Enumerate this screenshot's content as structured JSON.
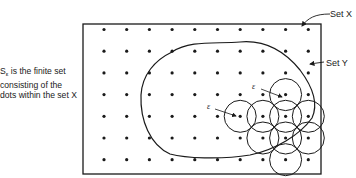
{
  "caption": {
    "symbol": "S",
    "subscript": "ε",
    "text": " is the finite set consisting of the dots within the set X"
  },
  "labels": {
    "set_x": "Set X",
    "set_y": "Set Y",
    "epsilon": "ε"
  },
  "grid": {
    "columns": 10,
    "rows": 7
  },
  "circles": {
    "count": 9,
    "centers_grid": [
      [
        8,
        3
      ],
      [
        6,
        4
      ],
      [
        7,
        4
      ],
      [
        8,
        4
      ],
      [
        9,
        4
      ],
      [
        7,
        5
      ],
      [
        8,
        5
      ],
      [
        9,
        5
      ],
      [
        8,
        6
      ]
    ]
  },
  "epsilon_markers": [
    [
      8,
      3
    ],
    [
      6,
      4
    ]
  ],
  "colors": {
    "ink": "#1a1a1a",
    "background": "#ffffff"
  }
}
